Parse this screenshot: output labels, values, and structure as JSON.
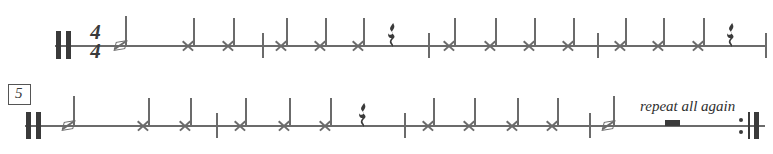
{
  "score": {
    "title_text": "",
    "ink_color": "#6b6b6b",
    "dark_ink_color": "#3a3a3a",
    "systems": [
      {
        "id": "system-1",
        "staff_y": 46,
        "staff_x": 55,
        "staff_width": 712,
        "opening_barline": "double-thick-barline",
        "time_signature": {
          "numerator": "4",
          "denominator": "4"
        },
        "rehearsal_mark": null,
        "direction_text": null,
        "closing_barline": "single-barline",
        "measures": [
          {
            "index": 1,
            "events": [
              {
                "type": "note",
                "notehead": "slash",
                "stem": "up",
                "x": 120,
                "label": "slash-note"
              },
              {
                "type": "note",
                "notehead": "x",
                "stem": "up",
                "x": 188,
                "label": "x-note"
              },
              {
                "type": "note",
                "notehead": "x",
                "stem": "up",
                "x": 228,
                "label": "x-note"
              }
            ],
            "barline_x": 262
          },
          {
            "index": 2,
            "events": [
              {
                "type": "note",
                "notehead": "x",
                "stem": "up",
                "x": 281,
                "label": "x-note"
              },
              {
                "type": "note",
                "notehead": "x",
                "stem": "up",
                "x": 320,
                "label": "x-note"
              },
              {
                "type": "note",
                "notehead": "x",
                "stem": "up",
                "x": 358,
                "label": "x-note"
              },
              {
                "type": "rest",
                "value": "quarter",
                "x": 391,
                "label": "quarter-rest"
              }
            ],
            "barline_x": 428
          },
          {
            "index": 3,
            "events": [
              {
                "type": "note",
                "notehead": "x",
                "stem": "up",
                "x": 449,
                "label": "x-note"
              },
              {
                "type": "note",
                "notehead": "x",
                "stem": "up",
                "x": 490,
                "label": "x-note"
              },
              {
                "type": "note",
                "notehead": "x",
                "stem": "up",
                "x": 529,
                "label": "x-note"
              },
              {
                "type": "note",
                "notehead": "x",
                "stem": "up",
                "x": 568,
                "label": "x-note"
              }
            ],
            "barline_x": 597
          },
          {
            "index": 4,
            "events": [
              {
                "type": "note",
                "notehead": "x",
                "stem": "up",
                "x": 620,
                "label": "x-note"
              },
              {
                "type": "note",
                "notehead": "x",
                "stem": "up",
                "x": 658,
                "label": "x-note"
              },
              {
                "type": "note",
                "notehead": "x",
                "stem": "up",
                "x": 698,
                "label": "x-note"
              },
              {
                "type": "rest",
                "value": "quarter",
                "x": 730,
                "label": "quarter-rest"
              }
            ],
            "barline_x": 766
          }
        ]
      },
      {
        "id": "system-2",
        "staff_y": 126,
        "staff_x": 25,
        "staff_width": 740,
        "opening_barline": "double-thick-barline",
        "time_signature": null,
        "rehearsal_mark": "5",
        "direction_text": "repeat all again",
        "closing_barline": "end-repeat-barline",
        "measures": [
          {
            "index": 1,
            "events": [
              {
                "type": "note",
                "notehead": "slash",
                "stem": "up",
                "x": 68,
                "label": "slash-note"
              },
              {
                "type": "note",
                "notehead": "x",
                "stem": "up",
                "x": 143,
                "label": "x-note"
              },
              {
                "type": "note",
                "notehead": "x",
                "stem": "up",
                "x": 185,
                "label": "x-note"
              }
            ],
            "barline_x": 216
          },
          {
            "index": 2,
            "events": [
              {
                "type": "note",
                "notehead": "x",
                "stem": "up",
                "x": 240,
                "label": "x-note"
              },
              {
                "type": "note",
                "notehead": "x",
                "stem": "up",
                "x": 284,
                "label": "x-note"
              },
              {
                "type": "note",
                "notehead": "x",
                "stem": "up",
                "x": 325,
                "label": "x-note"
              },
              {
                "type": "rest",
                "value": "quarter",
                "x": 362,
                "label": "quarter-rest"
              }
            ],
            "barline_x": 404
          },
          {
            "index": 3,
            "events": [
              {
                "type": "note",
                "notehead": "x",
                "stem": "up",
                "x": 428,
                "label": "x-note"
              },
              {
                "type": "note",
                "notehead": "x",
                "stem": "up",
                "x": 469,
                "label": "x-note"
              },
              {
                "type": "note",
                "notehead": "x",
                "stem": "up",
                "x": 512,
                "label": "x-note"
              },
              {
                "type": "note",
                "notehead": "x",
                "stem": "up",
                "x": 552,
                "label": "x-note"
              }
            ],
            "barline_x": 589
          },
          {
            "index": 4,
            "events": [
              {
                "type": "note",
                "notehead": "slash",
                "stem": "up",
                "x": 608,
                "label": "slash-note"
              },
              {
                "type": "rest",
                "value": "whole",
                "x": 668,
                "label": "whole-rest"
              }
            ],
            "barline_x": null
          }
        ]
      }
    ]
  }
}
